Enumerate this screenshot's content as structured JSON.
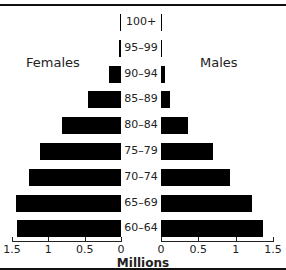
{
  "chart_data": {
    "type": "bar",
    "subtype": "population-pyramid",
    "title": "",
    "xlabel": "Millions",
    "ylabel": "",
    "categories": [
      "100+",
      "95–99",
      "90–94",
      "85–89",
      "80–84",
      "75–79",
      "70–74",
      "65–69",
      "60–64"
    ],
    "series": [
      {
        "name": "Females",
        "values": [
          0.01,
          0.03,
          0.16,
          0.45,
          0.8,
          1.1,
          1.25,
          1.43,
          1.42
        ]
      },
      {
        "name": "Males",
        "values": [
          0.0,
          0.02,
          0.05,
          0.12,
          0.37,
          0.71,
          0.94,
          1.24,
          1.39
        ]
      }
    ],
    "xlim": [
      0,
      1.5
    ],
    "left_ticks": [
      "1.5",
      "1",
      "0.5",
      "0"
    ],
    "right_ticks": [
      "0",
      "0.5",
      "1",
      "1.5"
    ],
    "legend": {
      "left": "Females",
      "right": "Males"
    }
  }
}
